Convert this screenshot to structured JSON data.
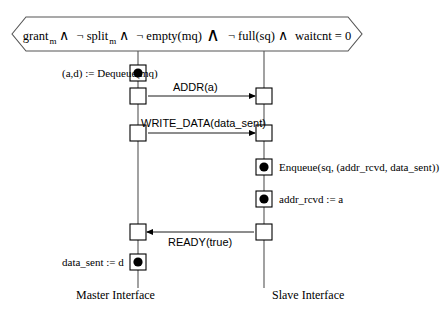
{
  "diagram": {
    "type": "uml-sequence-diagram",
    "guard": {
      "parts": [
        {
          "kind": "term",
          "text": "grant",
          "sub": "m"
        },
        {
          "kind": "op",
          "text": "∧"
        },
        {
          "kind": "term",
          "text": "¬ split",
          "sub": "m"
        },
        {
          "kind": "op",
          "text": "∧"
        },
        {
          "kind": "term",
          "text": "¬ empty(mq)",
          "sub": ""
        },
        {
          "kind": "bigop",
          "text": "∧"
        },
        {
          "kind": "term",
          "text": "¬ full(sq)",
          "sub": ""
        },
        {
          "kind": "op",
          "text": "∧"
        },
        {
          "kind": "term",
          "text": "waitcnt = 0",
          "sub": ""
        }
      ],
      "plain": "grant_m ∧ ¬ split_m ∧ ¬ empty(mq) ∧ ¬ full(sq) ∧ waitcnt = 0"
    },
    "lifelines": [
      {
        "id": "master",
        "label": "Master Interface",
        "x": 138
      },
      {
        "id": "slave",
        "label": "Slave Interface",
        "x": 264
      }
    ],
    "actions": [
      {
        "id": "dequeue",
        "label": "(a,d) := Dequeue(mq)",
        "lifeline": "master",
        "side": "left",
        "y": 73
      },
      {
        "id": "enqueue",
        "label": "Enqueue(sq, (addr_rcvd, data_sent))",
        "lifeline": "slave",
        "side": "right",
        "y": 167
      },
      {
        "id": "addr-assign",
        "label": "addr_rcvd := a",
        "lifeline": "slave",
        "side": "right",
        "y": 199
      },
      {
        "id": "data-assign",
        "label": "data_sent := d",
        "lifeline": "master",
        "side": "left",
        "y": 262
      }
    ],
    "messages": [
      {
        "id": "addr",
        "label": "ADDR(a)",
        "from": "master",
        "to": "slave",
        "direction": "right",
        "y": 96
      },
      {
        "id": "write-data",
        "label": "WRITE_DATA(data_sent)",
        "from": "master",
        "to": "slave",
        "direction": "right",
        "y": 133
      },
      {
        "id": "ready",
        "label": "READY(true)",
        "from": "slave",
        "to": "master",
        "direction": "left",
        "y": 232
      }
    ],
    "colors": {
      "stroke": "#000000",
      "lifeline": "#555555",
      "background": "#ffffff",
      "event_dot": "#000000"
    }
  }
}
